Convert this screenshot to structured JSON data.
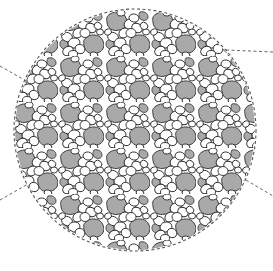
{
  "figure": {
    "type": "magnified-inset",
    "canvas": {
      "width": 273,
      "height": 271,
      "background": "#ffffff"
    },
    "circle": {
      "cx": 135,
      "cy": 130,
      "r": 121,
      "border_style": "dashed",
      "border_color": "#555555"
    },
    "colors": {
      "petal_fill": "#ffffff",
      "outline": "#2a2a2a",
      "background_fill": "#a9a9a9",
      "dash": "#666666"
    },
    "leader_lines": [
      {
        "name": "upper-left",
        "x1": 0,
        "y1": 66,
        "x2": 28,
        "y2": 82
      },
      {
        "name": "lower-left",
        "x1": 0,
        "y1": 200,
        "x2": 28,
        "y2": 184
      },
      {
        "name": "upper-right",
        "x1": 228,
        "y1": 50,
        "x2": 273,
        "y2": 52
      },
      {
        "name": "lower-right",
        "x1": 246,
        "y1": 180,
        "x2": 273,
        "y2": 196
      }
    ],
    "pattern": {
      "tile_size": 46,
      "motif": "flower-cluster",
      "petals_per_flower": 5
    }
  }
}
